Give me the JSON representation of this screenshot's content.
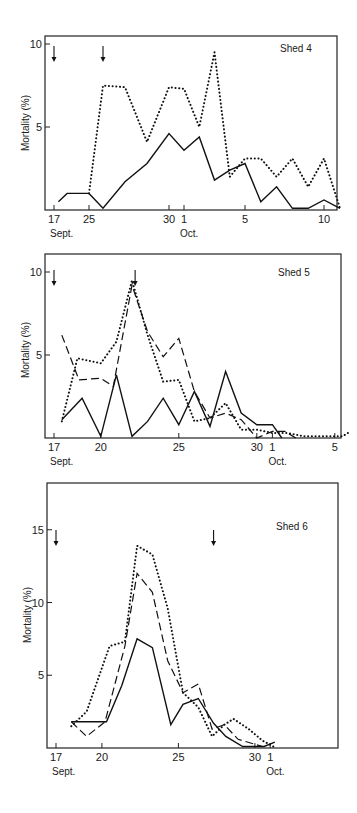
{
  "figure": {
    "ylabel": "Mortality (%)",
    "panels": [
      {
        "id": "shed4",
        "title": "Shed 4"
      },
      {
        "id": "shed5",
        "title": "Shed 5"
      },
      {
        "id": "shed6",
        "title": "Shed 6"
      }
    ]
  },
  "chart_data": [
    {
      "type": "line",
      "title": "Shed 4",
      "xlabel": "Date (Sept. - Oct.)",
      "ylabel": "Mortality (%)",
      "ylim": [
        0,
        10.5
      ],
      "yticks": [
        5,
        10
      ],
      "xtick_labels": [
        {
          "label": "17",
          "sub": "Sept.",
          "day_index": 0
        },
        {
          "label": "25",
          "day_index": 8
        },
        {
          "label": "30",
          "day_index": 13
        },
        {
          "label": "1",
          "sub": "Oct.",
          "day_index": 14
        },
        {
          "label": "5",
          "day_index": 18
        },
        {
          "label": "10",
          "day_index": 23
        }
      ],
      "arrows_at_day_index": [
        0,
        10
      ],
      "grid": false,
      "legend": "none",
      "series": [
        {
          "name": "solid",
          "style": "solid",
          "x": [
            1,
            3,
            8,
            10,
            11,
            13,
            15,
            16,
            17,
            19,
            20,
            21,
            23,
            24,
            26,
            27,
            28,
            29,
            30,
            31,
            32,
            33
          ],
          "values": [
            0.5,
            1.0,
            1.0,
            0.1,
            1.7,
            2.8,
            4.6,
            3.6,
            4.4,
            1.8,
            2.4,
            2.8,
            0.5,
            1.4,
            0.2,
            0.2,
            0.3,
            0.5,
            0.1,
            0.1,
            0.1,
            0.2
          ],
          "points": [
            [
              18,
              0.5
            ],
            [
              20,
              1.0
            ],
            [
              25,
              1.0
            ],
            [
              27,
              0.1
            ],
            [
              28,
              1.7
            ],
            [
              29,
              2.8
            ],
            [
              30,
              4.6
            ],
            [
              31,
              3.6
            ],
            [
              32,
              4.4
            ],
            [
              33,
              1.8
            ],
            [
              34,
              2.4
            ],
            [
              35,
              2.8
            ],
            [
              36,
              0.5
            ],
            [
              37,
              1.4
            ],
            [
              38,
              0.1
            ],
            [
              39,
              0.1
            ],
            [
              40,
              0.6
            ],
            [
              41,
              0.1
            ]
          ]
        },
        {
          "name": "dotted",
          "style": "dotted",
          "points": [
            [
              25,
              1.0
            ],
            [
              27,
              7.5
            ],
            [
              28,
              7.4
            ],
            [
              29,
              4.1
            ],
            [
              30,
              7.4
            ],
            [
              31,
              7.3
            ],
            [
              32,
              5.0
            ],
            [
              33,
              9.5
            ],
            [
              34,
              2.0
            ],
            [
              35,
              3.1
            ],
            [
              36,
              3.1
            ],
            [
              37,
              2.0
            ],
            [
              38,
              3.1
            ],
            [
              39,
              1.4
            ],
            [
              40,
              3.1
            ],
            [
              41,
              0.1
            ]
          ]
        }
      ]
    },
    {
      "type": "line",
      "title": "Shed 5",
      "xlabel": "Date (Sept. - Oct.)",
      "ylabel": "Mortality (%)",
      "ylim": [
        0,
        11
      ],
      "yticks": [
        5,
        10
      ],
      "xtick_labels": [
        {
          "label": "17",
          "sub": "Sept.",
          "day": 17
        },
        {
          "label": "20",
          "day": 20
        },
        {
          "label": "25",
          "day": 25
        },
        {
          "label": "30",
          "day": 30
        },
        {
          "label": "1",
          "sub": "Oct.",
          "day": 31
        },
        {
          "label": "5",
          "day": 35
        }
      ],
      "arrows_at_day": [
        17,
        22
      ],
      "grid": false,
      "legend": "none",
      "series": [
        {
          "name": "solid",
          "style": "solid",
          "points": [
            [
              17.5,
              1.1
            ],
            [
              18.8,
              2.4
            ],
            [
              20,
              0.1
            ],
            [
              21,
              3.8
            ],
            [
              22,
              0.1
            ],
            [
              23,
              1.0
            ],
            [
              24,
              2.4
            ],
            [
              25,
              0.8
            ],
            [
              26,
              2.8
            ],
            [
              27,
              0.7
            ],
            [
              28,
              4.0
            ],
            [
              29,
              1.5
            ],
            [
              30,
              0.8
            ],
            [
              31,
              0.8
            ],
            [
              31.6,
              0
            ]
          ]
        },
        {
          "name": "dashed",
          "style": "dashed",
          "points": [
            [
              17.5,
              6.2
            ],
            [
              18.6,
              3.5
            ],
            [
              20,
              3.6
            ],
            [
              20.8,
              3.1
            ],
            [
              22,
              9.2
            ],
            [
              23,
              6.4
            ],
            [
              24,
              4.9
            ],
            [
              25,
              6.0
            ],
            [
              26,
              2.8
            ],
            [
              27,
              1.2
            ],
            [
              28,
              1.5
            ],
            [
              29,
              1.1
            ],
            [
              30,
              0
            ],
            [
              31,
              0.4
            ],
            [
              31.8,
              0.4
            ],
            [
              32.5,
              0
            ]
          ]
        },
        {
          "name": "dotted",
          "style": "dotted",
          "points": [
            [
              17.5,
              1.0
            ],
            [
              18.5,
              4.8
            ],
            [
              20,
              4.5
            ],
            [
              21,
              5.8
            ],
            [
              22,
              9.5
            ],
            [
              23,
              6.2
            ],
            [
              24,
              3.4
            ],
            [
              25,
              3.5
            ],
            [
              26,
              1.0
            ],
            [
              27,
              1.2
            ],
            [
              28,
              2.1
            ],
            [
              29,
              0.5
            ],
            [
              30,
              0.5
            ],
            [
              31,
              0.3
            ],
            [
              32,
              0.3
            ],
            [
              33,
              0.1
            ],
            [
              35.5,
              0.1
            ],
            [
              36,
              0.4
            ]
          ]
        }
      ]
    },
    {
      "type": "line",
      "title": "Shed 6",
      "xlabel": "Date (Sept. - Oct.)",
      "ylabel": "Mortality (%)",
      "ylim": [
        0,
        17
      ],
      "yticks": [
        5,
        10,
        15
      ],
      "xtick_labels": [
        {
          "label": "17",
          "sub": "Sept.",
          "day": 17
        },
        {
          "label": "20",
          "day": 20
        },
        {
          "label": "25",
          "day": 25
        },
        {
          "label": "30",
          "day": 30
        },
        {
          "label": "1",
          "sub": "Oct.",
          "day": 31
        }
      ],
      "arrows_at_day": [
        17,
        27.5
      ],
      "grid": false,
      "legend": "none",
      "series": [
        {
          "name": "solid",
          "style": "solid",
          "points": [
            [
              18,
              1.8
            ],
            [
              19.5,
              1.8
            ],
            [
              20.3,
              1.8
            ],
            [
              21.3,
              4.3
            ],
            [
              22.3,
              7.5
            ],
            [
              23.3,
              6.9
            ],
            [
              24.5,
              1.6
            ],
            [
              25.3,
              3.0
            ],
            [
              26.3,
              3.4
            ],
            [
              27.3,
              1.7
            ],
            [
              28.1,
              0.8
            ],
            [
              29.2,
              0.1
            ],
            [
              30.6,
              0.1
            ],
            [
              31.3,
              0.4
            ]
          ]
        },
        {
          "name": "dashed",
          "style": "dashed",
          "points": [
            [
              18,
              1.8
            ],
            [
              19,
              0.8
            ],
            [
              20.2,
              1.8
            ],
            [
              21.5,
              7.0
            ],
            [
              22.3,
              12.0
            ],
            [
              23.3,
              10.7
            ],
            [
              24.3,
              6.0
            ],
            [
              25.3,
              3.8
            ],
            [
              26.3,
              4.4
            ],
            [
              27.2,
              1.3
            ],
            [
              28,
              1.6
            ],
            [
              28.9,
              0.6
            ],
            [
              30.5,
              0.1
            ]
          ]
        },
        {
          "name": "dotted",
          "style": "dotted",
          "points": [
            [
              18,
              1.5
            ],
            [
              19,
              2.5
            ],
            [
              20.5,
              7.0
            ],
            [
              21.5,
              7.3
            ],
            [
              22.3,
              13.9
            ],
            [
              23.3,
              13.3
            ],
            [
              24.3,
              9.6
            ],
            [
              25.3,
              3.8
            ],
            [
              26.3,
              2.8
            ],
            [
              27.2,
              0.8
            ],
            [
              28,
              1.6
            ],
            [
              28.6,
              2.0
            ],
            [
              29.6,
              1.3
            ],
            [
              30.5,
              0.5
            ],
            [
              31.2,
              0.1
            ]
          ]
        }
      ]
    }
  ]
}
